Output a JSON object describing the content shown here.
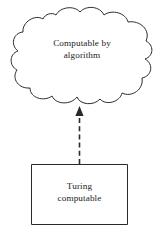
{
  "diagram": {
    "type": "relationship-diagram",
    "background_color": "#ffffff",
    "stroke_color": "#2a2a2a",
    "text_color": "#1c1c1c",
    "nodes": [
      {
        "id": "cloud",
        "shape": "cloud",
        "label_line1": "Computable by",
        "label_line2": "algorithm"
      },
      {
        "id": "box",
        "shape": "rectangle",
        "label_line1": "Turing",
        "label_line2": "computable"
      }
    ],
    "connector": {
      "id": "box-to-cloud-arrow",
      "style": "dashed",
      "direction": "up",
      "from": "box",
      "to": "cloud",
      "arrowhead": "solid-triangle"
    }
  }
}
